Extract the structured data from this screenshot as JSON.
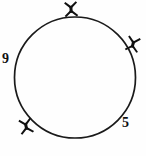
{
  "figure": {
    "type": "geometry-diagram",
    "background_color": "#fefefe",
    "stroke_color": "#1a1a1a",
    "mark_color": "#111111",
    "circle": {
      "center_x": 75,
      "center_y": 77,
      "radius": 61,
      "stroke_width": 1.6,
      "fill": "none"
    },
    "marks": [
      {
        "id": "mark-top",
        "glyph": "x-cross-mark",
        "x": 71,
        "y": 9,
        "angle_deg": 95,
        "size": 15,
        "rotation": -4
      },
      {
        "id": "mark-right",
        "glyph": "x-cross-mark",
        "x": 133,
        "y": 44,
        "angle_deg": 33,
        "size": 15,
        "rotation": 12
      },
      {
        "id": "mark-bottom-left",
        "glyph": "x-cross-mark",
        "x": 26,
        "y": 126,
        "angle_deg": 230,
        "size": 15,
        "rotation": -10
      }
    ],
    "labels": [
      {
        "id": "label-left",
        "text": "9",
        "x": 2,
        "y": 52,
        "position": "left-outside"
      },
      {
        "id": "label-bottom-right",
        "text": "5",
        "x": 122,
        "y": 116,
        "position": "bottom-right-outside"
      }
    ]
  }
}
